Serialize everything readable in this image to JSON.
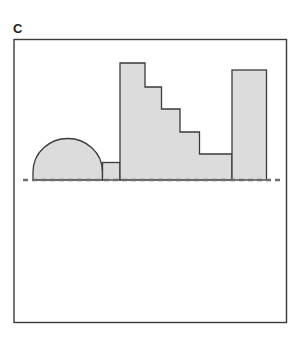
{
  "panel": {
    "label": "C"
  },
  "colors": {
    "stroke": "#3a3a3a",
    "fill": "#dcdcdc",
    "dash": "#6e6e6e",
    "background": "#ffffff"
  },
  "figure": {
    "frame": {
      "x": 14,
      "y": 39.5,
      "width": 272.5,
      "height": 283
    },
    "baseline": {
      "y": 180,
      "x1": 23,
      "x2": 281,
      "style": "dashed"
    },
    "shapes": [
      {
        "name": "dome",
        "type": "semi-ellipse",
        "left": 33,
        "right": 102.5,
        "top": 138.5,
        "base": 180
      },
      {
        "name": "small-block",
        "type": "rect",
        "x": 102.5,
        "y": 162.5,
        "width": 17.5,
        "height": 17.5
      },
      {
        "name": "staircase",
        "type": "polygon",
        "points": [
          [
            120,
            180
          ],
          [
            120,
            63
          ],
          [
            145,
            63
          ],
          [
            145,
            87
          ],
          [
            161.5,
            87
          ],
          [
            161.5,
            109
          ],
          [
            180,
            109
          ],
          [
            180,
            132
          ],
          [
            199.5,
            132
          ],
          [
            199.5,
            154
          ],
          [
            232,
            154
          ],
          [
            232,
            180
          ]
        ]
      },
      {
        "name": "tall-block",
        "type": "rect",
        "x": 232,
        "y": 70,
        "width": 34.5,
        "height": 110
      }
    ]
  }
}
